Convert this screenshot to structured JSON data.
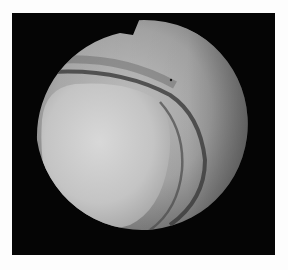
{
  "image": {
    "description": "Grayscale endoscopic view inside a circular aperture with a notch at top",
    "background": "#fdfdfd",
    "frame_color": "#050505",
    "colors": {
      "field_light": "#c8c8c8",
      "field_mid": "#9a9a9a",
      "field_dark": "#5a5a5a",
      "mass_light": "#d6d6d6",
      "mass_mid": "#b4b4b4",
      "edge_line": "#3a3a3a"
    }
  }
}
